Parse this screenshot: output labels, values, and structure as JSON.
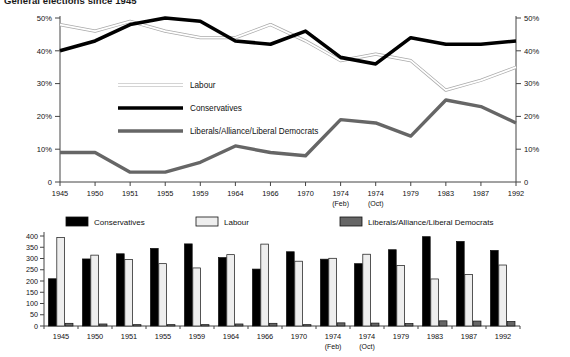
{
  "title": "General elections since 1945",
  "line_chart": {
    "legend": [
      {
        "label": "Labour",
        "key": "labour",
        "color": "#d9d9d9",
        "style": "outlined-thin"
      },
      {
        "label": "Conservatives",
        "key": "conservatives",
        "color": "#000000",
        "style": "thick-black"
      },
      {
        "label": "Liberals/Alliance/Liberal Democrats",
        "key": "liberals",
        "color": "#666666",
        "style": "thick-grey"
      }
    ],
    "y_left_label": "",
    "y_right_label": ""
  },
  "bar_chart": {
    "legend": [
      {
        "label": "Conservatives",
        "key": "conservatives",
        "color": "#000000"
      },
      {
        "label": "Labour",
        "key": "labour",
        "color": "#eeeeee"
      },
      {
        "label": "Liberals/Alliance/Liberal Democrats",
        "key": "liberals",
        "color": "#666666"
      }
    ]
  },
  "chart_data": [
    {
      "type": "line",
      "title": "General elections since 1945 — share of vote",
      "xlabel": "",
      "ylabel": "",
      "ylim": [
        0,
        50
      ],
      "yticks": [
        "0",
        "10%",
        "20%",
        "30%",
        "40%",
        "50%"
      ],
      "ytick_values": [
        0,
        10,
        20,
        30,
        40,
        50
      ],
      "y_axis_right": true,
      "yticks_right": [
        "0",
        "10%",
        "20%",
        "30%",
        "40%",
        "50%"
      ],
      "grid": false,
      "legend_position": "inside-left",
      "categories": [
        "1945",
        "1950",
        "1951",
        "1955",
        "1959",
        "1964",
        "1966",
        "1970",
        "1974",
        "1974",
        "1979",
        "1983",
        "1987",
        "1992"
      ],
      "category_sublabels": [
        "",
        "",
        "",
        "",
        "",
        "",
        "",
        "",
        "(Feb)",
        "(Oct)",
        "",
        "",
        "",
        ""
      ],
      "series": [
        {
          "name": "Labour",
          "color": "#d9d9d9",
          "values": [
            48,
            46,
            49,
            46,
            44,
            44,
            48,
            43,
            37,
            39,
            37,
            28,
            31,
            35
          ]
        },
        {
          "name": "Conservatives",
          "color": "#000000",
          "values": [
            40,
            43,
            48,
            50,
            49,
            43,
            42,
            46,
            38,
            36,
            44,
            42,
            42,
            43
          ]
        },
        {
          "name": "Liberals/Alliance/Liberal Democrats",
          "color": "#666666",
          "values": [
            9,
            9,
            3,
            3,
            6,
            11,
            9,
            8,
            19,
            18,
            14,
            25,
            23,
            18
          ]
        }
      ]
    },
    {
      "type": "bar",
      "title": "General elections since 1945 — seats won",
      "xlabel": "",
      "ylabel": "",
      "ylim": [
        0,
        400
      ],
      "yticks": [
        "0",
        "50",
        "100",
        "150",
        "200",
        "250",
        "300",
        "350",
        "400"
      ],
      "ytick_values": [
        0,
        50,
        100,
        150,
        200,
        250,
        300,
        350,
        400
      ],
      "grid": false,
      "legend_position": "top",
      "categories": [
        "1945",
        "1950",
        "1951",
        "1955",
        "1959",
        "1964",
        "1966",
        "1970",
        "1974",
        "1974",
        "1979",
        "1983",
        "1987",
        "1992"
      ],
      "category_sublabels": [
        "",
        "",
        "",
        "",
        "",
        "",
        "",
        "",
        "(Feb)",
        "(Oct)",
        "",
        "",
        "",
        ""
      ],
      "series": [
        {
          "name": "Conservatives",
          "color": "#000000",
          "values": [
            210,
            298,
            321,
            345,
            365,
            304,
            253,
            330,
            297,
            277,
            339,
            397,
            376,
            336
          ]
        },
        {
          "name": "Labour",
          "color": "#eeeeee",
          "values": [
            393,
            315,
            295,
            277,
            258,
            317,
            364,
            288,
            301,
            319,
            269,
            209,
            229,
            271
          ]
        },
        {
          "name": "Liberals/Alliance/Liberal Democrats",
          "color": "#666666",
          "values": [
            12,
            9,
            6,
            6,
            6,
            9,
            12,
            6,
            14,
            13,
            11,
            23,
            22,
            20
          ]
        }
      ]
    }
  ]
}
